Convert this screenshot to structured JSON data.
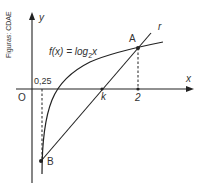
{
  "figure": {
    "credit": "Figuras: CDAE",
    "function_label": "f(x) = log",
    "function_base": "2",
    "function_arg": "x",
    "axis_labels": {
      "x": "x",
      "y": "y",
      "origin": "O"
    },
    "points": {
      "A": "A",
      "B": "B"
    },
    "line_label": "r",
    "x_marks": {
      "quarter": "0,25",
      "k": "k",
      "two": "2"
    },
    "colors": {
      "ink": "#222222",
      "text": "#333333",
      "background": "#ffffff"
    }
  }
}
